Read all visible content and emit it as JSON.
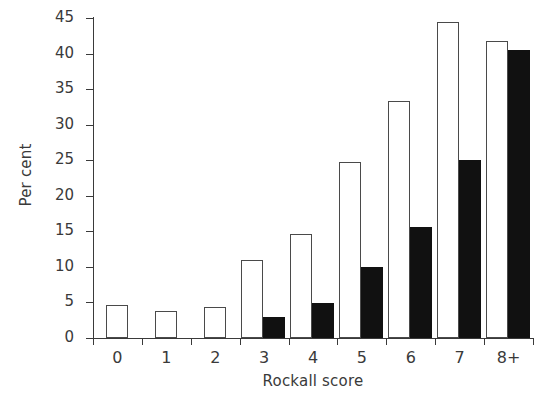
{
  "chart_data": {
    "type": "bar",
    "title": "",
    "subtitle": "",
    "xlabel": "Rockall score",
    "ylabel": "Per cent",
    "categories": [
      "0",
      "1",
      "2",
      "3",
      "4",
      "5",
      "6",
      "7",
      "8+"
    ],
    "ylim": [
      0,
      45
    ],
    "yticks": [
      0,
      5,
      10,
      15,
      20,
      25,
      30,
      35,
      40,
      45
    ],
    "ytick_labels": [
      "0",
      "5",
      "10",
      "15",
      "20",
      "25",
      "30",
      "35",
      "40",
      "45"
    ],
    "grid": false,
    "legend": "none",
    "legend_position": "none",
    "series": [
      {
        "name": "open",
        "style": "white-filled-with-black-outline",
        "color": "#ffffff",
        "edge_color": "#4a4a4a",
        "values": [
          4.6,
          3.8,
          4.3,
          11.0,
          14.6,
          24.7,
          33.4,
          44.4,
          41.8
        ]
      },
      {
        "name": "filled",
        "style": "solid-black",
        "color": "#111111",
        "edge_color": "#111111",
        "values": [
          0,
          0,
          0,
          3.0,
          4.9,
          10.0,
          15.6,
          25.0,
          40.5
        ]
      }
    ]
  },
  "axis": {
    "y_label": "Per cent",
    "x_label": "Rockall score"
  }
}
